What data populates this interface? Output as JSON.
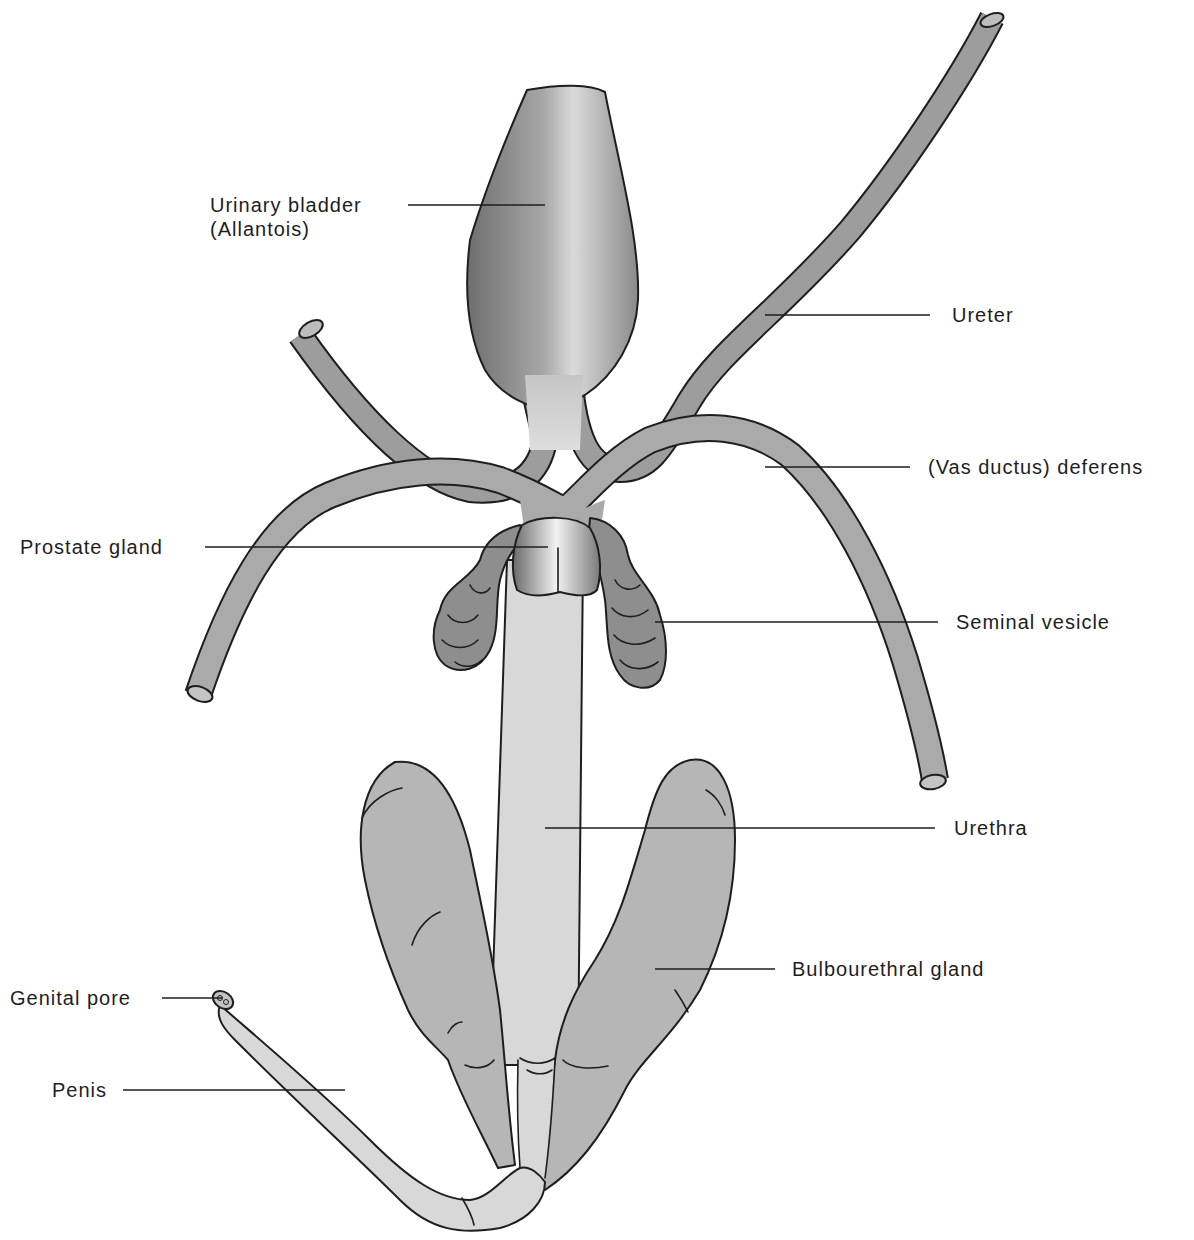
{
  "figure": {
    "colors": {
      "background": "#ffffff",
      "outline": "#1e1e1e",
      "duct_gray": "#9d9d9d",
      "light_gray": "#d8d8d8",
      "gland_gray": "#b6b6b6",
      "vesicle_gray": "#8e8e8e",
      "bladder_dark": "#6e6e6e",
      "bladder_light": "#d6d6d6"
    },
    "labels": [
      {
        "id": "urinary-bladder",
        "lines": [
          "Urinary bladder",
          "(Allantois)"
        ]
      },
      {
        "id": "ureter",
        "lines": [
          "Ureter"
        ]
      },
      {
        "id": "vas-deferens",
        "lines": [
          "(Vas ductus) deferens"
        ]
      },
      {
        "id": "prostate-gland",
        "lines": [
          "Prostate gland"
        ]
      },
      {
        "id": "seminal-vesicle",
        "lines": [
          "Seminal vesicle"
        ]
      },
      {
        "id": "urethra",
        "lines": [
          "Urethra"
        ]
      },
      {
        "id": "bulbourethral-gland",
        "lines": [
          "Bulbourethral gland"
        ]
      },
      {
        "id": "genital-pore",
        "lines": [
          "Genital pore"
        ]
      },
      {
        "id": "penis",
        "lines": [
          "Penis"
        ]
      }
    ]
  }
}
